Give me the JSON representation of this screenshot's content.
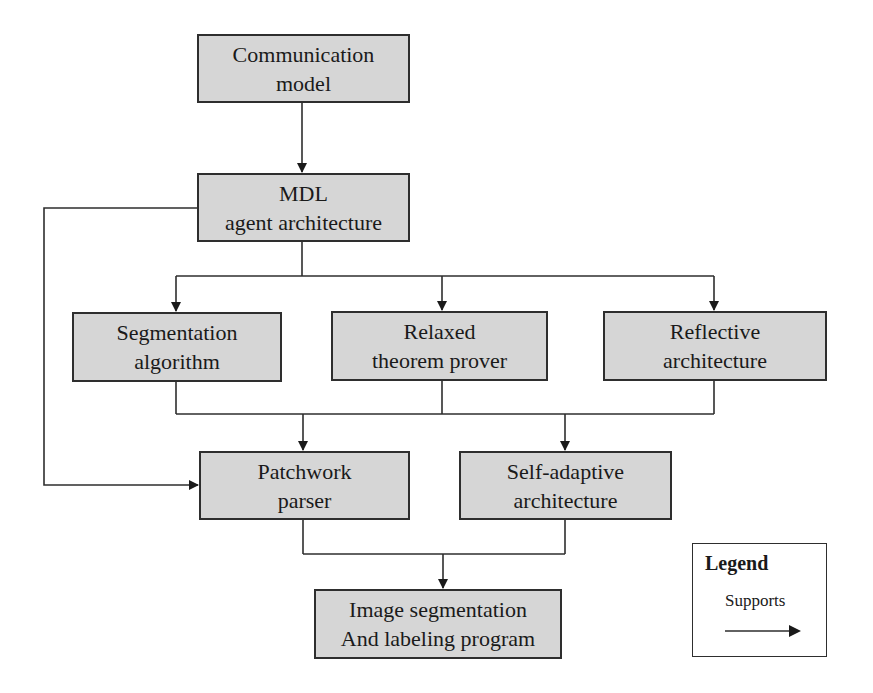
{
  "diagram": {
    "type": "flowchart",
    "nodes": {
      "communication": {
        "line1": "Communication",
        "line2": "model"
      },
      "mdl": {
        "line1": "MDL",
        "line2": "agent architecture"
      },
      "segmentation": {
        "line1": "Segmentation",
        "line2": "algorithm"
      },
      "relaxed": {
        "line1": "Relaxed",
        "line2": "theorem prover"
      },
      "reflective": {
        "line1": "Reflective",
        "line2": "architecture"
      },
      "patchwork": {
        "line1": "Patchwork",
        "line2": "parser"
      },
      "self_adaptive": {
        "line1": "Self-adaptive",
        "line2": "architecture"
      },
      "image_seg": {
        "line1": "Image segmentation",
        "line2": "And labeling program"
      }
    },
    "edges": [
      {
        "from": "Communication model",
        "to": "MDL agent architecture",
        "relation": "Supports"
      },
      {
        "from": "MDL agent architecture",
        "to": "Segmentation algorithm",
        "relation": "Supports"
      },
      {
        "from": "MDL agent architecture",
        "to": "Relaxed theorem prover",
        "relation": "Supports"
      },
      {
        "from": "MDL agent architecture",
        "to": "Reflective architecture",
        "relation": "Supports"
      },
      {
        "from": "MDL agent architecture",
        "to": "Patchwork parser",
        "relation": "Supports"
      },
      {
        "from": "Segmentation algorithm + Relaxed theorem prover + Reflective architecture",
        "to": "Patchwork parser",
        "relation": "Supports"
      },
      {
        "from": "Segmentation algorithm + Relaxed theorem prover + Reflective architecture",
        "to": "Self-adaptive architecture",
        "relation": "Supports"
      },
      {
        "from": "Patchwork parser + Self-adaptive architecture",
        "to": "Image segmentation And labeling program",
        "relation": "Supports"
      }
    ],
    "legend": {
      "title": "Legend",
      "items": [
        {
          "label": "Supports",
          "symbol": "arrow-right"
        }
      ]
    },
    "colors": {
      "node_fill": "#d6d6d6",
      "stroke": "#2e2e2e",
      "background": "#ffffff"
    }
  }
}
